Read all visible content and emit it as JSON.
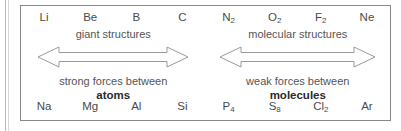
{
  "figure": {
    "name": "bonding-structure-trend-diagram",
    "border_color": "#8a8a8a",
    "background": "#ffffff",
    "arrow_stroke_color": "#9a9a9a",
    "text_color": "#4a4a4a",
    "bold_text_color": "#2b2b2b"
  },
  "columns": [
    {
      "top": "Li",
      "top_sub": "",
      "bottom": "Na",
      "bottom_sub": ""
    },
    {
      "top": "Be",
      "top_sub": "",
      "bottom": "Mg",
      "bottom_sub": ""
    },
    {
      "top": "B",
      "top_sub": "",
      "bottom": "Al",
      "bottom_sub": ""
    },
    {
      "top": "C",
      "top_sub": "",
      "bottom": "Si",
      "bottom_sub": ""
    },
    {
      "top": "N",
      "top_sub": "2",
      "bottom": "P",
      "bottom_sub": "4"
    },
    {
      "top": "O",
      "top_sub": "2",
      "bottom": "S",
      "bottom_sub": "8"
    },
    {
      "top": "F",
      "top_sub": "2",
      "bottom": "Cl",
      "bottom_sub": "2"
    },
    {
      "top": "Ne",
      "top_sub": "",
      "bottom": "Ar",
      "bottom_sub": ""
    }
  ],
  "halves": [
    {
      "structure_label": "giant structures",
      "forces_label": "strong forces between",
      "forces_term": "atoms",
      "arrow_name": "giant-structures-range-arrow"
    },
    {
      "structure_label": "molecular structures",
      "forces_label": "weak forces between",
      "forces_term": "molecules",
      "arrow_name": "molecular-structures-range-arrow"
    }
  ]
}
